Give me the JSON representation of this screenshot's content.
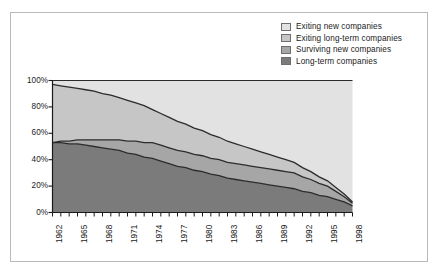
{
  "legend": {
    "position": "top-right",
    "items": [
      {
        "label": "Exiting new companies",
        "color": "#e2e2e2"
      },
      {
        "label": "Exiting long-term companies",
        "color": "#c6c6c6"
      },
      {
        "label": "Surviving new companies",
        "color": "#a6a6a6"
      },
      {
        "label": "Long-term companies",
        "color": "#7b7b7b"
      }
    ]
  },
  "axes": {
    "y_ticks": [
      "0%",
      "20%",
      "40%",
      "60%",
      "80%",
      "100%"
    ],
    "x_ticks": [
      "1962",
      "1965",
      "1968",
      "1971",
      "1974",
      "1977",
      "1980",
      "1983",
      "1986",
      "1989",
      "1992",
      "1995",
      "1998"
    ]
  },
  "chart_data": {
    "type": "area",
    "stacked": true,
    "title": "",
    "xlabel": "",
    "ylabel": "",
    "ylim": [
      0,
      100
    ],
    "grid": false,
    "legend_position": "top-right",
    "x": [
      1962,
      1963,
      1964,
      1965,
      1966,
      1967,
      1968,
      1969,
      1970,
      1971,
      1972,
      1973,
      1974,
      1975,
      1976,
      1977,
      1978,
      1979,
      1980,
      1981,
      1982,
      1983,
      1984,
      1985,
      1986,
      1987,
      1988,
      1989,
      1990,
      1991,
      1992,
      1993,
      1994,
      1995,
      1996,
      1997,
      1998
    ],
    "series": [
      {
        "name": "Long-term companies",
        "color": "#7b7b7b",
        "values": [
          53,
          53,
          52,
          52,
          51,
          50,
          49,
          48,
          47,
          45,
          44,
          42,
          41,
          39,
          37,
          35,
          34,
          32,
          31,
          29,
          28,
          26,
          25,
          24,
          23,
          22,
          21,
          20,
          19,
          18,
          16,
          15,
          13,
          12,
          10,
          8,
          5
        ]
      },
      {
        "name": "Surviving new companies",
        "color": "#a6a6a6",
        "values": [
          0,
          1,
          2,
          3,
          4,
          5,
          6,
          7,
          8,
          9,
          10,
          11,
          12,
          12,
          12,
          12,
          12,
          12,
          12,
          12,
          12,
          12,
          12,
          12,
          12,
          12,
          12,
          12,
          12,
          12,
          11,
          10,
          9,
          8,
          6,
          4,
          2
        ]
      },
      {
        "name": "Exiting long-term companies",
        "color": "#c6c6c6",
        "values": [
          44,
          42,
          41,
          39,
          38,
          37,
          35,
          34,
          32,
          31,
          29,
          28,
          25,
          24,
          23,
          22,
          21,
          20,
          19,
          18,
          17,
          16,
          15,
          14,
          13,
          12,
          11,
          10,
          9,
          8,
          7,
          6,
          5,
          4,
          3,
          2,
          1
        ]
      },
      {
        "name": "Exiting new companies",
        "color": "#e2e2e2",
        "values": [
          3,
          4,
          5,
          6,
          7,
          8,
          10,
          11,
          13,
          15,
          17,
          19,
          22,
          25,
          28,
          31,
          33,
          36,
          38,
          41,
          43,
          46,
          48,
          50,
          52,
          54,
          56,
          58,
          60,
          62,
          66,
          69,
          73,
          76,
          81,
          86,
          92
        ]
      }
    ]
  }
}
